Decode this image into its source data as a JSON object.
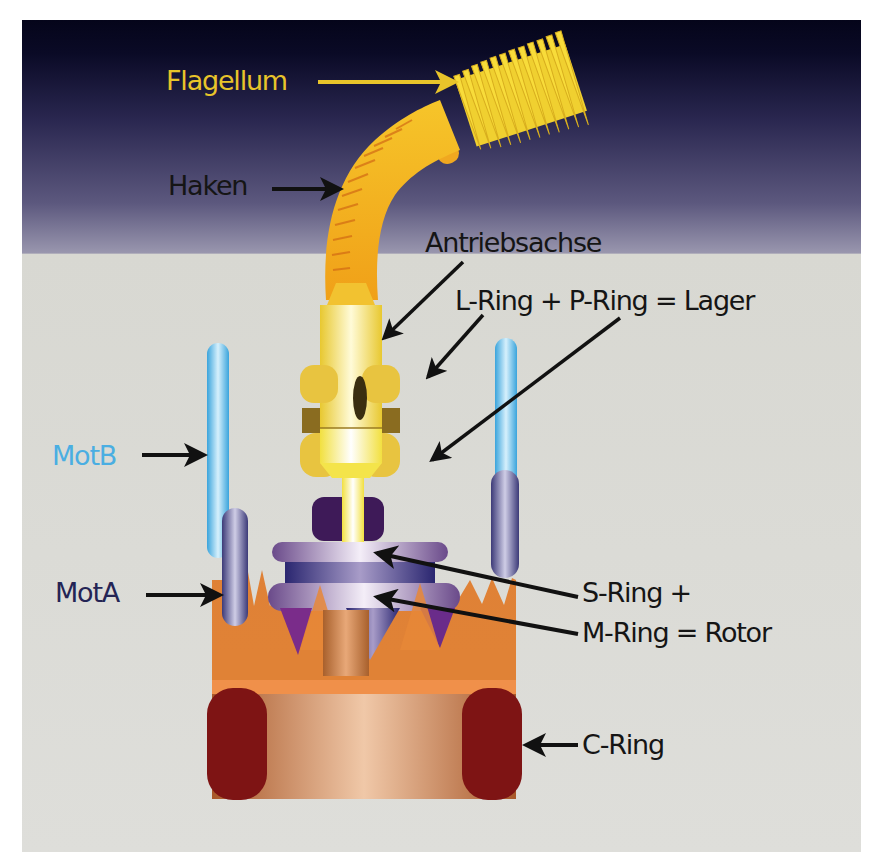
{
  "diagram": {
    "colors": {
      "background_top": "#05051c",
      "background_mid": "#6e6a8c",
      "background_bottom": "#dcdcd6",
      "flagellum": "#f2d43a",
      "flagellum_label": "#e8c42a",
      "motb": "#4aaee2",
      "mota": "#242455",
      "text": "#151515",
      "arrow": "#111111"
    },
    "labels": {
      "flagellum": "Flagellum",
      "haken": "Haken",
      "antriebsachse": "Antriebsachse",
      "lager": "L-Ring + P-Ring = Lager",
      "motb": "MotB",
      "mota": "MotA",
      "rotor_line1": "S-Ring +",
      "rotor_line2": "M-Ring = Rotor",
      "c_ring": "C-Ring"
    },
    "components": [
      {
        "name": "Flagellum",
        "role": "filament"
      },
      {
        "name": "Haken",
        "role": "hook"
      },
      {
        "name": "Antriebsachse",
        "role": "drive shaft"
      },
      {
        "name": "L-Ring + P-Ring",
        "role": "Lager (bearing)"
      },
      {
        "name": "MotB",
        "role": "stator anchor"
      },
      {
        "name": "MotA",
        "role": "stator"
      },
      {
        "name": "S-Ring + M-Ring",
        "role": "Rotor"
      },
      {
        "name": "C-Ring",
        "role": "switch complex"
      }
    ]
  }
}
